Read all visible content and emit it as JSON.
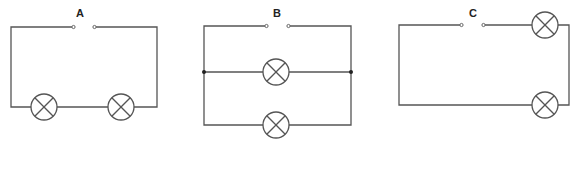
{
  "diagram": {
    "colors": {
      "wire": "#555555",
      "background": "#ffffff",
      "label": "#222222"
    },
    "circuits": [
      {
        "id": "A",
        "label": "A",
        "type": "series",
        "lamps": 2,
        "switch": "open"
      },
      {
        "id": "B",
        "label": "B",
        "type": "parallel",
        "lamps": 2,
        "switch": "open"
      },
      {
        "id": "C",
        "label": "C",
        "type": "parallel-right",
        "lamps": 2,
        "switch": "open"
      }
    ]
  }
}
